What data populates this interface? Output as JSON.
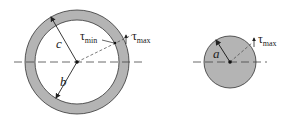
{
  "figure": {
    "left": {
      "name": "hollow-shaft-cross-section",
      "labels": {
        "outer_radius": "c",
        "inner_radius": "b",
        "tau_min_symbol": "τ",
        "tau_min_sub": "min",
        "tau_max_symbol": "τ",
        "tau_max_sub": "max"
      }
    },
    "right": {
      "name": "solid-shaft-cross-section",
      "labels": {
        "radius": "a",
        "tau_max_symbol": "τ",
        "tau_max_sub": "max"
      }
    },
    "colors": {
      "fill": "#b4b4b4",
      "stroke": "#333333",
      "line": "#444444"
    }
  }
}
